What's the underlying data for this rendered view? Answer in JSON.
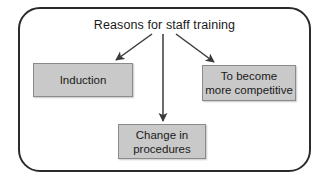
{
  "diagram": {
    "title": "Reasons for staff training",
    "type": "flowchart-radial",
    "background_color": "#ffffff",
    "frame": {
      "shape": "rounded-rectangle",
      "border_color": "#2b2b2b",
      "fill_color": "#ffffff"
    },
    "node_style": {
      "fill_color": "#c9c9c9",
      "border_color": "#8a8a8a",
      "text_color": "#1a1a1a"
    },
    "arrow_color": "#3a3a3a",
    "nodes": [
      {
        "id": "induction",
        "label": "Induction",
        "position": "left"
      },
      {
        "id": "procedures",
        "label": "Change in\nprocedures",
        "position": "bottom-center"
      },
      {
        "id": "competitive",
        "label": "To become\nmore competitive",
        "position": "right"
      }
    ],
    "edges": [
      {
        "from": "title",
        "to": "induction",
        "direction": "down-left"
      },
      {
        "from": "title",
        "to": "procedures",
        "direction": "down"
      },
      {
        "from": "title",
        "to": "competitive",
        "direction": "down-right"
      }
    ]
  }
}
